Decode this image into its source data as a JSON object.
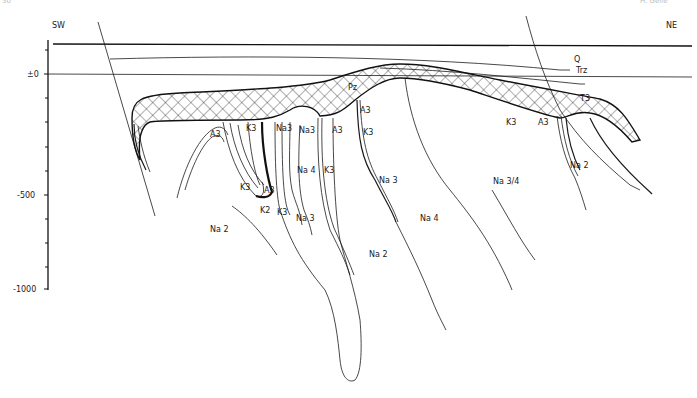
{
  "header": {
    "page_number": "30",
    "running_head": "H. Geile"
  },
  "orientation": {
    "left": "SW",
    "right": "NE"
  },
  "axis": {
    "ticks": [
      "±0",
      "-500",
      "-1000"
    ]
  },
  "strata_labels": {
    "q": "Q",
    "trz": "Trz",
    "t3": "T3",
    "pz": "Pz"
  },
  "zone_labels": [
    {
      "id": "a3_left",
      "text": "A3"
    },
    {
      "id": "k3_top_left",
      "text": "K3"
    },
    {
      "id": "na3_top",
      "text": "Na3"
    },
    {
      "id": "na3_mid",
      "text": "Na3"
    },
    {
      "id": "a3_mid",
      "text": "A3"
    },
    {
      "id": "a3_right_top",
      "text": "A3"
    },
    {
      "id": "k3_right_top",
      "text": "K3"
    },
    {
      "id": "na4_center",
      "text": "Na 4"
    },
    {
      "id": "k3_center",
      "text": "K3"
    },
    {
      "id": "k3_fold",
      "text": "K3"
    },
    {
      "id": "a3_fold",
      "text": "A3"
    },
    {
      "id": "k2_fold",
      "text": "K2"
    },
    {
      "id": "k3_lower",
      "text": "K3"
    },
    {
      "id": "na3_lower",
      "text": "Na 3"
    },
    {
      "id": "na3_diag",
      "text": "Na 3"
    },
    {
      "id": "na2_left",
      "text": "Na 2"
    },
    {
      "id": "na2_center",
      "text": "Na 2"
    },
    {
      "id": "na4_right",
      "text": "Na 4"
    },
    {
      "id": "na34",
      "text": "Na 3/4"
    },
    {
      "id": "k3_ne",
      "text": "K3"
    },
    {
      "id": "a3_ne",
      "text": "A3"
    },
    {
      "id": "na2_ne",
      "text": "Na 2"
    }
  ]
}
